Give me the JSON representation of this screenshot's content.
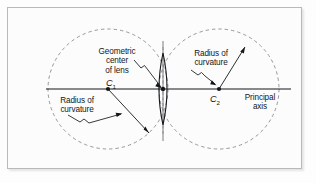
{
  "figure": {
    "title_alt": "Biconvex lens with centers of curvature diagram",
    "background_color": "#fcfcfc",
    "frame_color": "#b9b9b9",
    "ink_color": "#14171a",
    "dashed_color": "#8c8c8c"
  },
  "labels": {
    "geometric_center": "Geometric\ncenter\nof lens",
    "c1": "C",
    "c1_sub": "1",
    "radius_left": "Radius of\ncurvature",
    "radius_right": "Radius of\ncurvature",
    "c2": "C",
    "c2_sub": "2",
    "principal_axis": "Principal\naxis"
  },
  "geometry": {
    "principal_axis": {
      "x1": 45,
      "y1": 88,
      "x2": 290,
      "y2": 88
    },
    "lens_center": {
      "x": 162,
      "y": 88
    },
    "lens_half_height": 36,
    "lens_half_width": 7,
    "left_circle": {
      "cx": 107,
      "cy": 88,
      "r": 60
    },
    "right_circle": {
      "cx": 218,
      "cy": 88,
      "r": 60
    },
    "c1_point": {
      "x": 107,
      "y": 88
    },
    "c2_point": {
      "x": 218,
      "y": 88
    },
    "radius_line_left": {
      "x1": 107,
      "y1": 88,
      "x2": 148,
      "y2": 132
    },
    "radius_line_right": {
      "x1": 218,
      "y1": 88,
      "x2": 244,
      "y2": 46
    },
    "vertical_axis_solid": {
      "x": 162,
      "y1": 40,
      "y2": 140
    },
    "vertical_axis_dashed": {
      "x": 162,
      "y1": 46,
      "y2": 134
    }
  }
}
